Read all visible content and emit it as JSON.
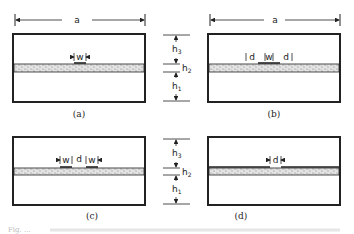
{
  "figure": {
    "dimension_width_label": "a",
    "height_labels": {
      "h1": "h",
      "h1_sub": "1",
      "h2": "h",
      "h2_sub": "2",
      "h3": "h",
      "h3_sub": "3"
    },
    "panels": [
      {
        "id": "a",
        "caption": "(a)",
        "strip_labels": [
          "w"
        ]
      },
      {
        "id": "b",
        "caption": "(b)",
        "strip_labels": [
          "d",
          "w",
          "d"
        ]
      },
      {
        "id": "c",
        "caption": "(c)",
        "strip_labels": [
          "w",
          "d",
          "w"
        ]
      },
      {
        "id": "d",
        "caption": "(d)",
        "strip_labels": [
          "d"
        ]
      }
    ],
    "caption_text": "Fig. ..."
  },
  "colors": {
    "line": "#222222",
    "dielectric": "#d8d8d8",
    "background": "#ffffff"
  }
}
